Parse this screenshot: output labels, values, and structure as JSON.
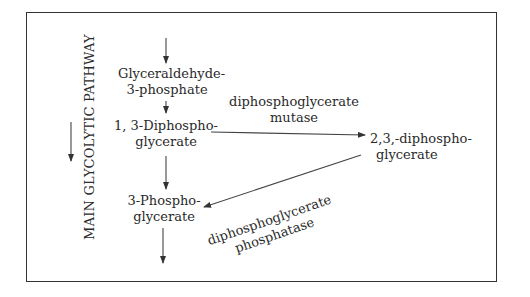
{
  "diagram": {
    "side_label": "MAIN GLYCOLYTIC PATHWAY",
    "nodes": {
      "g3p": {
        "line1": "Glyceraldehyde-",
        "line2": "3-phosphate"
      },
      "bpg13": {
        "line1": "1, 3-Diphospho-",
        "line2": "glycerate"
      },
      "pg3": {
        "line1": "3-Phospho-",
        "line2": "glycerate"
      },
      "bpg23": {
        "line1": "2,3,-diphospho-",
        "line2": "glycerate"
      }
    },
    "enzymes": {
      "mutase": {
        "line1": "diphosphoglycerate",
        "line2": "mutase"
      },
      "phosphatase": {
        "line1": "diphosphoglycerate",
        "line2": "phosphatase"
      }
    },
    "edges": [
      {
        "from": "input",
        "to": "g3p"
      },
      {
        "from": "g3p",
        "to": "bpg13"
      },
      {
        "from": "bpg13",
        "to": "pg3"
      },
      {
        "from": "bpg13",
        "to": "bpg23",
        "enzyme": "mutase"
      },
      {
        "from": "bpg23",
        "to": "pg3",
        "enzyme": "phosphatase"
      },
      {
        "from": "pg3",
        "to": "output"
      }
    ]
  }
}
